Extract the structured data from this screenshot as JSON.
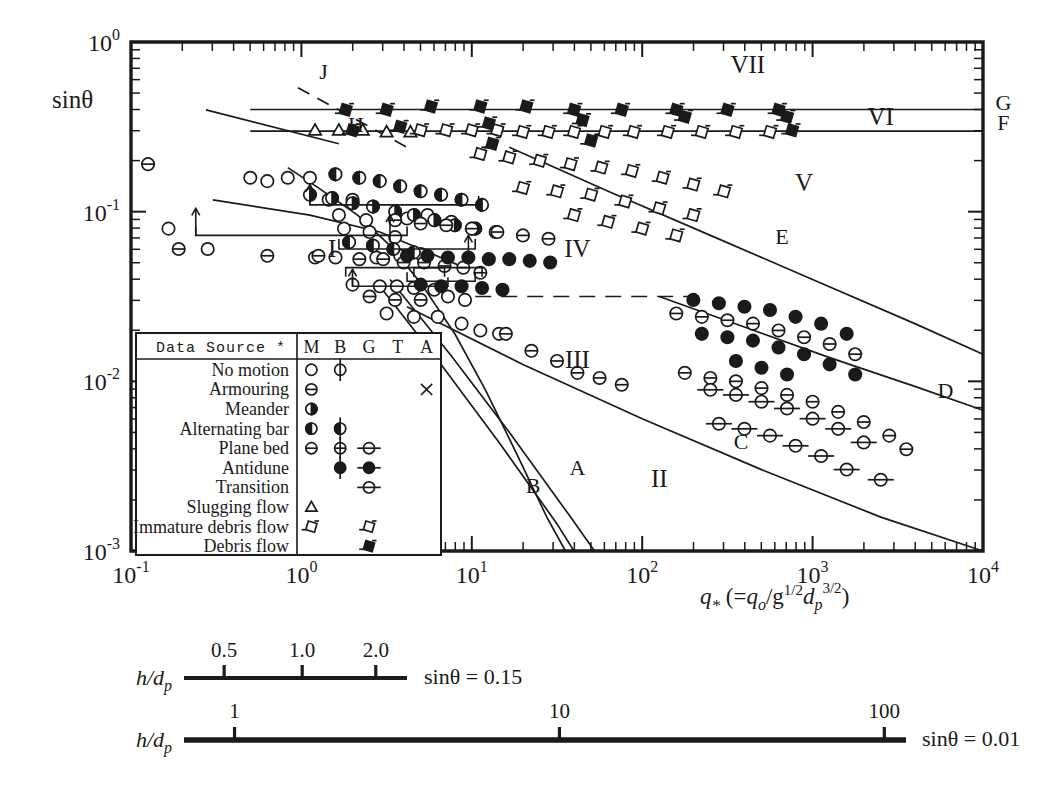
{
  "figure": {
    "type": "scatter",
    "background": "#ffffff",
    "ink": "#1a1a1a"
  },
  "axes": {
    "ylabel": "sinθ",
    "xlabel_main": "q",
    "xlabel_sub": "*",
    "xlabel_paren_open": "(=",
    "xlabel_q": "q",
    "xlabel_q_sub": "o",
    "xlabel_slash": "/g",
    "xlabel_g_exp": "1/2",
    "xlabel_d": "d",
    "xlabel_d_sub": "p",
    "xlabel_d_exp": "3/2",
    "xlabel_paren_close": ")",
    "x_ticks": [
      {
        "mant": "10",
        "exp": "-1"
      },
      {
        "mant": "10",
        "exp": "0"
      },
      {
        "mant": "10",
        "exp": "1"
      },
      {
        "mant": "10",
        "exp": "2"
      },
      {
        "mant": "10",
        "exp": "3"
      },
      {
        "mant": "10",
        "exp": "4"
      }
    ],
    "y_ticks": [
      {
        "mant": "10",
        "exp": "0"
      },
      {
        "mant": "10",
        "exp": "-1"
      },
      {
        "mant": "10",
        "exp": "-2"
      },
      {
        "mant": "10",
        "exp": "-3"
      }
    ],
    "xlim": [
      -1,
      4
    ],
    "ylim": [
      -3,
      0
    ],
    "scale": "log-log",
    "grid": false
  },
  "region_labels": [
    {
      "text": "I",
      "x": 0.18,
      "y": -1.27
    },
    {
      "text": "II",
      "x": 2.1,
      "y": -2.62
    },
    {
      "text": "III",
      "x": 1.62,
      "y": -1.92
    },
    {
      "text": "IV",
      "x": 1.62,
      "y": -1.27
    },
    {
      "text": "V",
      "x": 2.95,
      "y": -0.88
    },
    {
      "text": "VI",
      "x": 3.4,
      "y": -0.49
    },
    {
      "text": "VII",
      "x": 2.62,
      "y": -0.18
    }
  ],
  "curve_labels": [
    {
      "text": "A",
      "x": 1.62,
      "y": -2.55
    },
    {
      "text": "B",
      "x": 1.36,
      "y": -2.66
    },
    {
      "text": "C",
      "x": 2.58,
      "y": -2.4
    },
    {
      "text": "D",
      "x": 3.78,
      "y": -2.1
    },
    {
      "text": "E",
      "x": 2.82,
      "y": -1.19
    },
    {
      "text": "F",
      "x": 4.12,
      "y": -0.52
    },
    {
      "text": "G",
      "x": 4.12,
      "y": -0.4
    },
    {
      "text": "H",
      "x": 0.32,
      "y": -0.53
    },
    {
      "text": "J",
      "x": 0.13,
      "y": -0.22
    }
  ],
  "legend": {
    "title": "Data Source *",
    "columns": [
      "M",
      "B",
      "G",
      "T",
      "A"
    ],
    "rows": [
      {
        "label": "No motion",
        "markers": {
          "M": "open-circle",
          "B": "open-circle-vbar"
        }
      },
      {
        "label": "Armouring",
        "markers": {
          "M": "hbar-circle",
          "A": "cross"
        }
      },
      {
        "label": "Meander",
        "markers": {
          "M": "right-half-circle"
        }
      },
      {
        "label": "Alternating bar",
        "markers": {
          "M": "left-half-circle",
          "B": "vbar-half-circle"
        }
      },
      {
        "label": "Plane bed",
        "markers": {
          "M": "hbar-circle",
          "B": "hbar-circle-vbar",
          "G": "hbar-open-circle"
        }
      },
      {
        "label": "Antidune",
        "markers": {
          "B": "filled-circle-vbar",
          "G": "filled-circle-hbar"
        }
      },
      {
        "label": "Transition",
        "markers": {
          "G": "hbar-circle-wide"
        }
      },
      {
        "label": "Slugging flow",
        "markers": {
          "M": "open-triangle"
        }
      },
      {
        "label": "Immature debris flow",
        "markers": {
          "M": "skew-square",
          "G": "skew-square"
        }
      },
      {
        "label": "Debris flow",
        "markers": {
          "G": "filled-skew-square"
        }
      }
    ]
  },
  "scale_bars": [
    {
      "name": "h-over-dp-upper",
      "label_h": "h",
      "label_slash": "/d",
      "label_sub": "p",
      "ticks": [
        "0.5",
        "1.0",
        "2.0"
      ],
      "tick_pos": [
        0.18,
        0.53,
        0.86
      ],
      "condition_prefix": "sin",
      "condition_theta": "θ",
      "condition_eq": " = ",
      "condition_value": "0.15"
    },
    {
      "name": "h-over-dp-lower",
      "label_h": "h",
      "label_slash": "/d",
      "label_sub": "p",
      "ticks": [
        "1",
        "10",
        "100"
      ],
      "tick_pos": [
        0.07,
        0.52,
        0.97
      ],
      "condition_prefix": "sin",
      "condition_theta": "θ",
      "condition_eq": " = ",
      "condition_value": "0.01"
    }
  ],
  "chart_data": {
    "type": "scatter",
    "title": "",
    "xlabel": "q* (= qo / g^1/2 dp^3/2)",
    "ylabel": "sinθ",
    "xlim": [
      -1,
      4
    ],
    "ylim": [
      -3,
      0
    ],
    "xscale": "log",
    "yscale": "log",
    "grid": false,
    "legend_position": "inset-lower-left",
    "series": [
      {
        "name": "No motion",
        "marker": "open-circle",
        "points": [
          [
            -0.78,
            -1.1
          ],
          [
            -0.55,
            -1.22
          ],
          [
            -0.3,
            -0.8
          ],
          [
            -0.2,
            -0.82
          ],
          [
            -0.08,
            -0.8
          ],
          [
            0.05,
            -0.8
          ],
          [
            0.16,
            -0.93
          ],
          [
            0.22,
            -1.02
          ],
          [
            0.3,
            -0.93
          ],
          [
            0.38,
            -1.05
          ],
          [
            0.08,
            -1.27
          ],
          [
            0.2,
            -1.27
          ],
          [
            0.44,
            -1.27
          ],
          [
            0.58,
            -1.26
          ],
          [
            0.7,
            -1.25
          ],
          [
            0.3,
            -1.43
          ],
          [
            0.46,
            -1.44
          ],
          [
            0.56,
            -1.44
          ],
          [
            0.66,
            -1.45
          ],
          [
            0.78,
            -1.46
          ],
          [
            0.86,
            -1.5
          ],
          [
            0.96,
            -1.52
          ],
          [
            0.5,
            -1.6
          ],
          [
            0.66,
            -1.62
          ],
          [
            0.8,
            -1.62
          ],
          [
            0.94,
            -1.66
          ],
          [
            1.05,
            -1.7
          ],
          [
            1.16,
            -1.72
          ],
          [
            0.25,
            -1.1
          ],
          [
            0.4,
            -1.12
          ],
          [
            0.55,
            -1.15
          ],
          [
            0.62,
            -1.04
          ],
          [
            0.74,
            -1.02
          ],
          [
            0.88,
            -1.06
          ],
          [
            1.0,
            -1.1
          ]
        ]
      },
      {
        "name": "Armouring",
        "marker": "hbar-circle",
        "points": [
          [
            -0.9,
            -0.72
          ],
          [
            -0.72,
            -1.22
          ],
          [
            -0.2,
            -1.26
          ],
          [
            0.1,
            -1.26
          ],
          [
            0.34,
            -1.28
          ],
          [
            0.48,
            -1.28
          ],
          [
            0.6,
            -1.3
          ],
          [
            0.72,
            -1.3
          ],
          [
            0.84,
            -1.32
          ],
          [
            0.95,
            -1.33
          ],
          [
            1.05,
            -1.36
          ],
          [
            0.4,
            -1.5
          ],
          [
            0.55,
            -1.52
          ],
          [
            0.7,
            -1.52
          ],
          [
            1.2,
            -1.72
          ],
          [
            1.35,
            -1.82
          ],
          [
            1.5,
            -1.88
          ],
          [
            1.62,
            -1.95
          ],
          [
            1.75,
            -1.98
          ],
          [
            1.88,
            -2.02
          ]
        ]
      },
      {
        "name": "Meander",
        "marker": "right-half-circle",
        "points": [
          [
            0.05,
            -0.9
          ],
          [
            0.18,
            -0.92
          ],
          [
            0.3,
            -0.95
          ],
          [
            0.42,
            -0.97
          ],
          [
            0.55,
            -1.0
          ],
          [
            0.66,
            -1.02
          ],
          [
            0.78,
            -1.05
          ],
          [
            0.9,
            -1.08
          ],
          [
            1.02,
            -1.1
          ],
          [
            1.14,
            -1.12
          ]
        ]
      },
      {
        "name": "Alternating bar",
        "marker": "left-half-circle",
        "points": [
          [
            0.2,
            -0.78
          ],
          [
            0.34,
            -0.8
          ],
          [
            0.46,
            -0.82
          ],
          [
            0.58,
            -0.85
          ],
          [
            0.7,
            -0.88
          ],
          [
            0.82,
            -0.9
          ],
          [
            0.94,
            -0.93
          ],
          [
            1.06,
            -0.96
          ],
          [
            0.28,
            -1.18
          ],
          [
            0.42,
            -1.2
          ],
          [
            0.54,
            -1.22
          ],
          [
            0.66,
            -1.24
          ]
        ]
      },
      {
        "name": "Plane bed",
        "marker": "hbar-circle",
        "points": [
          [
            0.55,
            -1.05
          ],
          [
            0.7,
            -1.07
          ],
          [
            0.85,
            -1.08
          ],
          [
            1.0,
            -1.1
          ],
          [
            1.15,
            -1.12
          ],
          [
            1.3,
            -1.14
          ],
          [
            1.45,
            -1.16
          ],
          [
            2.2,
            -1.6
          ],
          [
            2.35,
            -1.62
          ],
          [
            2.5,
            -1.64
          ],
          [
            2.65,
            -1.66
          ],
          [
            2.8,
            -1.7
          ],
          [
            2.95,
            -1.74
          ],
          [
            3.1,
            -1.78
          ],
          [
            3.25,
            -1.84
          ],
          [
            2.25,
            -1.95
          ],
          [
            2.4,
            -1.98
          ],
          [
            2.55,
            -2.0
          ],
          [
            2.7,
            -2.04
          ],
          [
            2.85,
            -2.08
          ],
          [
            3.0,
            -2.12
          ],
          [
            3.15,
            -2.18
          ],
          [
            3.3,
            -2.24
          ],
          [
            3.45,
            -2.32
          ],
          [
            3.55,
            -2.4
          ]
        ]
      },
      {
        "name": "Antidune",
        "marker": "filled-circle",
        "points": [
          [
            0.62,
            -1.26
          ],
          [
            0.74,
            -1.26
          ],
          [
            0.86,
            -1.27
          ],
          [
            0.98,
            -1.27
          ],
          [
            1.1,
            -1.28
          ],
          [
            1.22,
            -1.28
          ],
          [
            1.34,
            -1.29
          ],
          [
            1.46,
            -1.3
          ],
          [
            0.7,
            -1.43
          ],
          [
            0.82,
            -1.44
          ],
          [
            0.94,
            -1.44
          ],
          [
            1.06,
            -1.45
          ],
          [
            1.18,
            -1.46
          ],
          [
            2.3,
            -1.52
          ],
          [
            2.45,
            -1.54
          ],
          [
            2.6,
            -1.56
          ],
          [
            2.75,
            -1.58
          ],
          [
            2.9,
            -1.62
          ],
          [
            3.05,
            -1.66
          ],
          [
            3.2,
            -1.72
          ],
          [
            2.35,
            -1.72
          ],
          [
            2.5,
            -1.74
          ],
          [
            2.65,
            -1.76
          ],
          [
            2.8,
            -1.8
          ],
          [
            2.95,
            -1.84
          ],
          [
            3.1,
            -1.9
          ],
          [
            3.25,
            -1.96
          ],
          [
            2.55,
            -1.88
          ],
          [
            2.7,
            -1.92
          ],
          [
            2.85,
            -1.96
          ]
        ]
      },
      {
        "name": "Transition",
        "marker": "hbar-circle-wide",
        "points": [
          [
            2.4,
            -2.05
          ],
          [
            2.55,
            -2.08
          ],
          [
            2.7,
            -2.12
          ],
          [
            2.85,
            -2.16
          ],
          [
            3.0,
            -2.22
          ],
          [
            3.15,
            -2.28
          ],
          [
            3.3,
            -2.36
          ],
          [
            2.45,
            -2.25
          ],
          [
            2.6,
            -2.28
          ],
          [
            2.75,
            -2.32
          ],
          [
            2.9,
            -2.38
          ],
          [
            3.05,
            -2.44
          ],
          [
            3.2,
            -2.52
          ],
          [
            3.4,
            -2.58
          ]
        ]
      },
      {
        "name": "Slugging flow",
        "marker": "open-triangle",
        "points": [
          [
            0.08,
            -0.52
          ],
          [
            0.22,
            -0.52
          ],
          [
            0.36,
            -0.52
          ],
          [
            0.5,
            -0.53
          ],
          [
            0.64,
            -0.53
          ]
        ]
      },
      {
        "name": "Immature debris flow",
        "marker": "skew-square",
        "points": [
          [
            0.7,
            -0.52
          ],
          [
            0.85,
            -0.52
          ],
          [
            1.0,
            -0.52
          ],
          [
            1.15,
            -0.52
          ],
          [
            1.3,
            -0.53
          ],
          [
            1.45,
            -0.53
          ],
          [
            1.6,
            -0.53
          ],
          [
            1.78,
            -0.53
          ],
          [
            1.95,
            -0.53
          ],
          [
            2.15,
            -0.53
          ],
          [
            2.35,
            -0.53
          ],
          [
            2.55,
            -0.53
          ],
          [
            2.75,
            -0.53
          ],
          [
            1.05,
            -0.66
          ],
          [
            1.22,
            -0.68
          ],
          [
            1.4,
            -0.7
          ],
          [
            1.58,
            -0.72
          ],
          [
            1.76,
            -0.74
          ],
          [
            1.94,
            -0.76
          ],
          [
            2.12,
            -0.8
          ],
          [
            2.3,
            -0.84
          ],
          [
            2.48,
            -0.88
          ],
          [
            1.3,
            -0.86
          ],
          [
            1.5,
            -0.88
          ],
          [
            1.7,
            -0.9
          ],
          [
            1.9,
            -0.94
          ],
          [
            2.1,
            -0.98
          ],
          [
            2.3,
            -1.02
          ],
          [
            1.6,
            -1.02
          ],
          [
            1.8,
            -1.06
          ],
          [
            2.0,
            -1.1
          ],
          [
            2.2,
            -1.14
          ]
        ]
      },
      {
        "name": "Debris flow",
        "marker": "filled-skew-square",
        "points": [
          [
            0.26,
            -0.4
          ],
          [
            0.5,
            -0.4
          ],
          [
            0.76,
            -0.38
          ],
          [
            1.05,
            -0.38
          ],
          [
            1.32,
            -0.38
          ],
          [
            1.6,
            -0.4
          ],
          [
            1.88,
            -0.4
          ],
          [
            2.2,
            -0.4
          ],
          [
            2.5,
            -0.4
          ],
          [
            2.8,
            -0.4
          ],
          [
            0.3,
            -0.52
          ],
          [
            0.58,
            -0.5
          ],
          [
            1.1,
            -0.48
          ],
          [
            1.65,
            -0.46
          ],
          [
            2.25,
            -0.44
          ],
          [
            2.85,
            -0.44
          ],
          [
            1.12,
            -0.6
          ],
          [
            1.7,
            -0.58
          ],
          [
            2.88,
            -0.52
          ]
        ]
      }
    ]
  }
}
